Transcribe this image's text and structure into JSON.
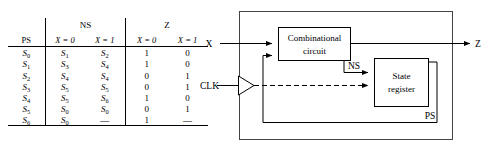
{
  "state_table": {
    "group_headers": {
      "ps": "PS",
      "ns": "NS",
      "z": "Z"
    },
    "sub_headers": {
      "ns_x0": "X = 0",
      "ns_x1": "X = 1",
      "z_x0": "X = 0",
      "z_x1": "X = 1"
    },
    "rows": [
      {
        "ps": "S",
        "ps_sub": "0",
        "ns_x0": "S",
        "ns_x0_sub": "1",
        "ns_x1": "S",
        "ns_x1_sub": "2",
        "z_x0": "1",
        "z_x1": "0"
      },
      {
        "ps": "S",
        "ps_sub": "1",
        "ns_x0": "S",
        "ns_x0_sub": "3",
        "ns_x1": "S",
        "ns_x1_sub": "4",
        "z_x0": "1",
        "z_x1": "0"
      },
      {
        "ps": "S",
        "ps_sub": "2",
        "ns_x0": "S",
        "ns_x0_sub": "4",
        "ns_x1": "S",
        "ns_x1_sub": "4",
        "z_x0": "0",
        "z_x1": "1"
      },
      {
        "ps": "S",
        "ps_sub": "3",
        "ns_x0": "S",
        "ns_x0_sub": "5",
        "ns_x1": "S",
        "ns_x1_sub": "5",
        "z_x0": "0",
        "z_x1": "1"
      },
      {
        "ps": "S",
        "ps_sub": "4",
        "ns_x0": "S",
        "ns_x0_sub": "5",
        "ns_x1": "S",
        "ns_x1_sub": "6",
        "z_x0": "1",
        "z_x1": "0"
      },
      {
        "ps": "S",
        "ps_sub": "5",
        "ns_x0": "S",
        "ns_x0_sub": "0",
        "ns_x1": "S",
        "ns_x1_sub": "0",
        "z_x0": "0",
        "z_x1": "1"
      },
      {
        "ps": "S",
        "ps_sub": "6",
        "ns_x0": "S",
        "ns_x0_sub": "0",
        "ns_x1": "—",
        "ns_x1_sub": "",
        "z_x0": "1",
        "z_x1": "—"
      }
    ]
  },
  "block_diagram": {
    "input_label": "X",
    "clock_label": "CLK",
    "output_label": "Z",
    "combinational_block_line1": "Combinational",
    "combinational_block_line2": "circuit",
    "register_block_line1": "State",
    "register_block_line2": "register",
    "next_state_label": "NS",
    "present_state_label": "PS"
  }
}
